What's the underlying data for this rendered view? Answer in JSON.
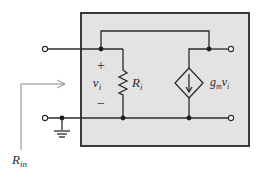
{
  "diagram": {
    "components": {
      "input_resistor": {
        "label": "R",
        "subscript": "i"
      },
      "input_voltage": {
        "symbol": "v",
        "subscript": "i",
        "plus": "+",
        "minus": "−"
      },
      "controlled_source": {
        "type": "voltage-controlled current source",
        "label_g": "g",
        "label_sub": "m",
        "label_v": "v",
        "label_vsub": "i"
      },
      "input_resistance_label": {
        "symbol": "R",
        "subscript": "in"
      }
    },
    "colors": {
      "box_fill": "#e3e3e3",
      "box_border": "#3a3a3a",
      "wire": "#2b2b2b"
    }
  }
}
